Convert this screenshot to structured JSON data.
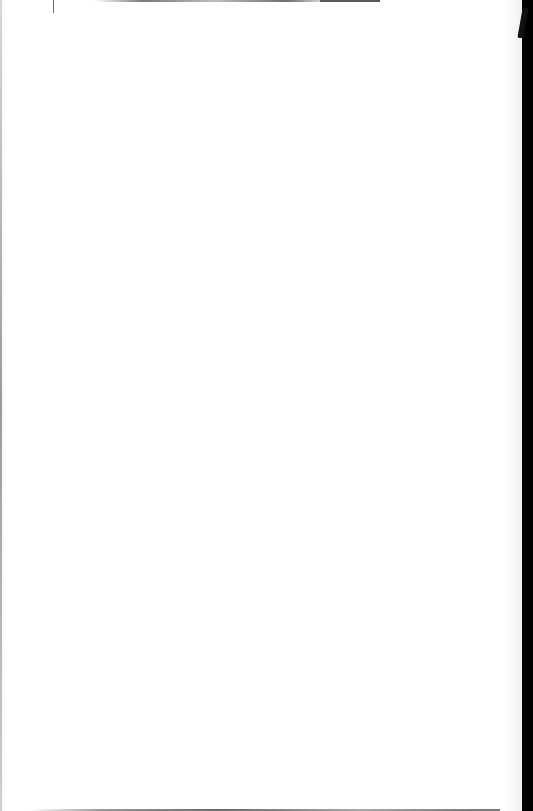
{
  "document": {
    "type": "scanned-page",
    "content": "",
    "background_color": "#ffffff",
    "border_color": "#000000"
  }
}
